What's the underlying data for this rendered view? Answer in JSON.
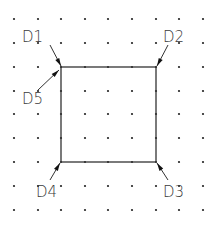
{
  "diagram": {
    "type": "cad-grid-rectangle-picks",
    "grid": {
      "xs": [
        14,
        38,
        61,
        85,
        108,
        132,
        156,
        179,
        203
      ],
      "ys": [
        19,
        43,
        67,
        91,
        114,
        138,
        162,
        186,
        210
      ],
      "dot_color": "#222222"
    },
    "rectangle": {
      "x1": 61,
      "y1": 67,
      "x2": 156,
      "y2": 162,
      "stroke": "#333333"
    },
    "callouts": [
      {
        "label": "D1",
        "text_x": 22,
        "text_y": 42,
        "from": [
          50,
          45
        ],
        "to": [
          61,
          66
        ]
      },
      {
        "label": "D2",
        "text_x": 163,
        "text_y": 42,
        "from": [
          168,
          45
        ],
        "to": [
          157,
          66
        ]
      },
      {
        "label": "D3",
        "text_x": 163,
        "text_y": 197,
        "from": [
          168,
          180
        ],
        "to": [
          157,
          163
        ]
      },
      {
        "label": "D4",
        "text_x": 36,
        "text_y": 197,
        "from": [
          50,
          180
        ],
        "to": [
          60,
          163
        ]
      },
      {
        "label": "D5",
        "text_x": 22,
        "text_y": 104,
        "from": [
          38,
          90
        ],
        "to": [
          59,
          70
        ]
      }
    ]
  }
}
